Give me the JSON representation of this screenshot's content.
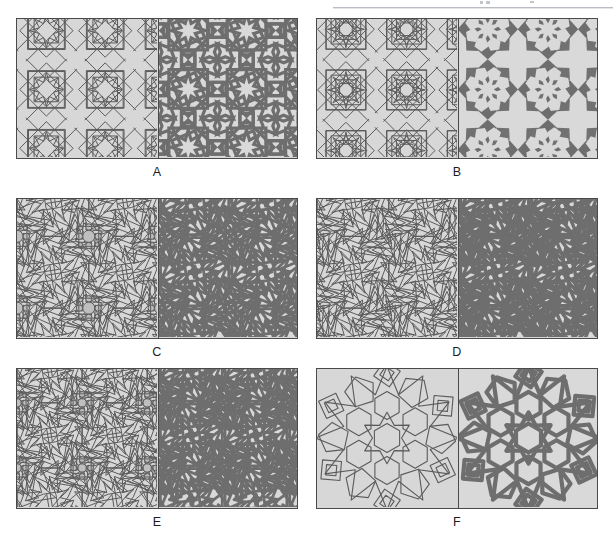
{
  "document": {
    "type": "figure",
    "title": "Islamic geometric pattern construction plate",
    "description": "Six labelled panels, each split vertically into a left half showing the underlying construction / polygonal sub-grid and a right half showing the finished interlaced strapwork derived from it."
  },
  "header": {
    "rule_visible": true,
    "rule_color": "#b9bcc2"
  },
  "style": {
    "background": "#ffffff",
    "panel_fill": "#d7d7d7",
    "panel_fill_dark": "#bfbfbf",
    "frame_stroke": "#4a4a4a",
    "line_stroke": "#5b5b5b",
    "strap_stroke": "#6e6e6e",
    "strap_fill": "#6e6e6e",
    "tile_light": "#d9d9d9",
    "caption_color": "#1d1d1d"
  },
  "figure": {
    "columns": 2,
    "rows": 3,
    "panel_width": 282,
    "panel_height": 141,
    "panels": [
      {
        "id": "A",
        "label": "A",
        "row": 0,
        "col": 0,
        "x": 16,
        "y": 18,
        "left_half": "construction-grid-8-fold-square",
        "right_half": "interlaced-strapwork-8-fold-square",
        "star_order": 8,
        "repeat_unit": "square",
        "motif": "eight-pointed star and cross"
      },
      {
        "id": "B",
        "label": "B",
        "row": 0,
        "col": 1,
        "x": 316,
        "y": 18,
        "left_half": "construction-grid-8-fold-dense",
        "right_half": "solid-tiling-8-fold",
        "star_order": 8,
        "repeat_unit": "square",
        "motif": "eight-pointed star rosette with filled ground"
      },
      {
        "id": "C",
        "label": "C",
        "row": 1,
        "col": 0,
        "x": 16,
        "y": 198,
        "left_half": "construction-grid-12-fold-rosette",
        "right_half": "interlaced-strapwork-12-fold-rosette",
        "star_order": 12,
        "repeat_unit": "square",
        "motif": "twelve-pointed rosette with circular nodes"
      },
      {
        "id": "D",
        "label": "D",
        "row": 1,
        "col": 1,
        "x": 316,
        "y": 198,
        "left_half": "construction-grid-12-fold-variant",
        "right_half": "interlaced-strapwork-12-fold-variant",
        "star_order": 12,
        "repeat_unit": "square",
        "motif": "twelve-pointed rosette, wide straps"
      },
      {
        "id": "E",
        "label": "E",
        "row": 2,
        "col": 0,
        "x": 16,
        "y": 368,
        "left_half": "construction-grid-12-fold-compound",
        "right_half": "interlaced-strapwork-12-fold-compound",
        "star_order": 12,
        "repeat_unit": "square",
        "motif": "compound rosette with secondary ring of circles"
      },
      {
        "id": "F",
        "label": "F",
        "row": 2,
        "col": 1,
        "x": 316,
        "y": 368,
        "left_half": "construction-grid-6-fold-large",
        "right_half": "interlaced-strapwork-6-fold-large",
        "star_order": 6,
        "repeat_unit": "hexagonal",
        "motif": "large six-fold star rosette with hexagonal core"
      }
    ]
  }
}
